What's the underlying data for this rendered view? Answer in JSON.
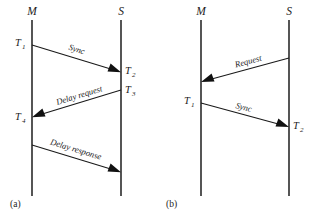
{
  "figure": {
    "background_color": "#ffffff",
    "line_color": "#2b2b2b",
    "text_color": "#1c1c1c",
    "panels": [
      {
        "id": "a",
        "caption": "(a)",
        "master_label": "M",
        "slave_label": "S",
        "timestamps": [
          {
            "name": "T",
            "subscript": "1",
            "side": "master"
          },
          {
            "name": "T",
            "subscript": "2",
            "side": "slave"
          },
          {
            "name": "T",
            "subscript": "3",
            "side": "slave"
          },
          {
            "name": "T",
            "subscript": "4",
            "side": "master"
          }
        ],
        "messages": [
          {
            "label": "Sync",
            "direction": "master-to-slave"
          },
          {
            "label": "Delay request",
            "direction": "slave-to-master"
          },
          {
            "label": "Delay response",
            "direction": "master-to-slave"
          }
        ]
      },
      {
        "id": "b",
        "caption": "(b)",
        "master_label": "M",
        "slave_label": "S",
        "timestamps": [
          {
            "name": "T",
            "subscript": "1",
            "side": "master"
          },
          {
            "name": "T",
            "subscript": "2",
            "side": "slave"
          }
        ],
        "messages": [
          {
            "label": "Request",
            "direction": "slave-to-master"
          },
          {
            "label": "Sync",
            "direction": "master-to-slave"
          }
        ]
      }
    ]
  }
}
